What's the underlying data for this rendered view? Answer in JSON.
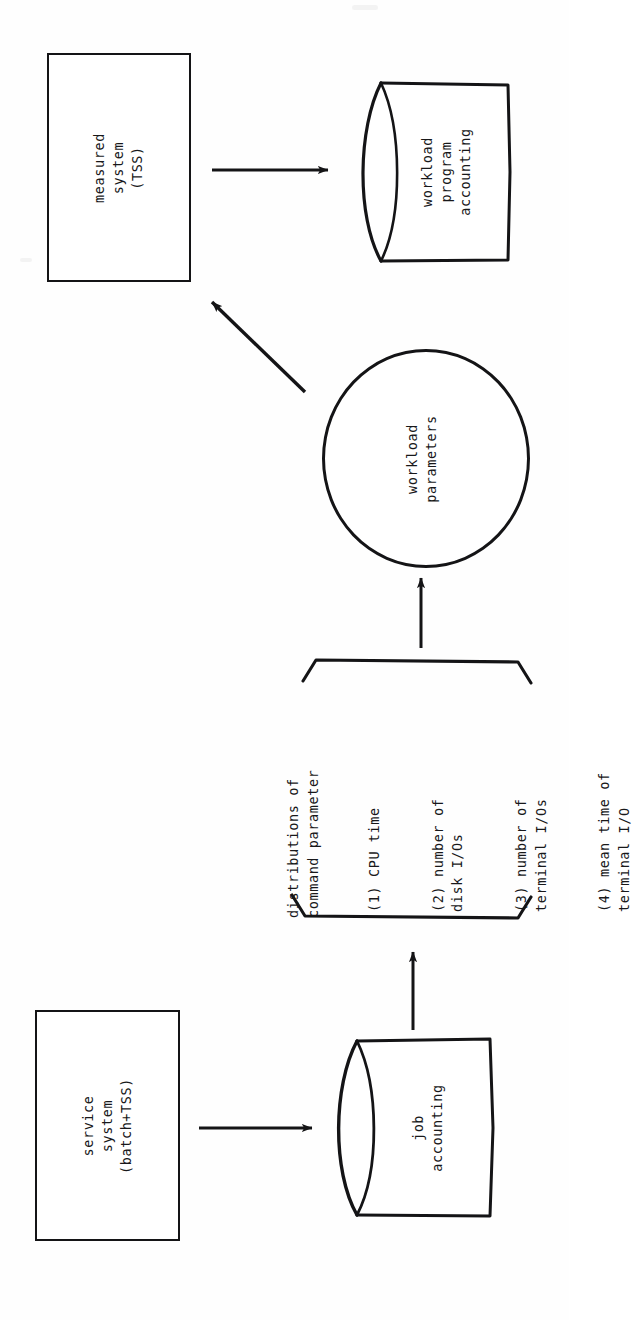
{
  "diagram": {
    "orientation": "rotated-90-ccw",
    "ink_color": "#141416",
    "paper_color": "#fefefe",
    "nodes": {
      "measured_system": {
        "shape": "rectangle",
        "label": "measured\nsystem\n(TSS)"
      },
      "workload_program_accounting": {
        "shape": "cylinder",
        "label": "workload\nprogram\naccounting"
      },
      "workload_parameters": {
        "shape": "circle",
        "label": "workload\nparameters"
      },
      "service_system": {
        "shape": "rectangle",
        "label": "service\nsystem\n(batch+TSS)"
      },
      "job_accounting": {
        "shape": "cylinder",
        "label": "job\naccounting"
      }
    },
    "parameter_group": {
      "caption": "distributions of\ncommand parameter",
      "bracket": "brace",
      "items": [
        {
          "num": "(1)",
          "text": "CPU time"
        },
        {
          "num": "(2)",
          "text": "number of\ndisk I/Os"
        },
        {
          "num": "(3)",
          "text": "number of\nterminal I/Os"
        },
        {
          "num": "(4)",
          "text": "mean time of\nterminal I/O"
        }
      ]
    },
    "edges": [
      {
        "name": "measured-system-to-workload-accounting",
        "from": "measured_system",
        "to": "workload_program_accounting",
        "style": "straight-arrow"
      },
      {
        "name": "workload-parameters-to-measured-system",
        "from": "workload_parameters",
        "to": "measured_system",
        "style": "diagonal-arrow"
      },
      {
        "name": "parameters-to-workload-parameters",
        "from": "parameter_group",
        "to": "workload_parameters",
        "style": "straight-arrow"
      },
      {
        "name": "service-system-to-job-accounting",
        "from": "service_system",
        "to": "job_accounting",
        "style": "straight-arrow"
      },
      {
        "name": "job-accounting-to-parameters",
        "from": "job_accounting",
        "to": "parameter_group",
        "style": "straight-arrow"
      }
    ]
  }
}
